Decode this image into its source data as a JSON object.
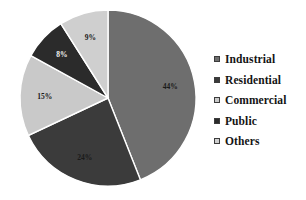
{
  "chart_data": {
    "type": "pie",
    "title": "",
    "subtitle": "",
    "xlabel": "",
    "ylabel": "",
    "grid": false,
    "legend_position": "right",
    "unit": "%",
    "categories": [
      "Industrial",
      "Residential",
      "Commercial",
      "Public",
      "Others"
    ],
    "values": [
      44,
      24,
      15,
      8,
      9
    ],
    "data_labels": [
      "44%",
      "24%",
      "15%",
      "8%",
      "9%"
    ],
    "colors": [
      "#6e6e6e",
      "#3b3b3b",
      "#c9c9c9",
      "#2b2b2b",
      "#cfcfcf"
    ],
    "slices": [
      {
        "name": "Industrial",
        "value": 44,
        "label": "44%",
        "color": "#6e6e6e",
        "label_color": "dark"
      },
      {
        "name": "Residential",
        "value": 24,
        "label": "24%",
        "color": "#3b3b3b",
        "label_color": "dark"
      },
      {
        "name": "Commercial",
        "value": 15,
        "label": "15%",
        "color": "#c9c9c9",
        "label_color": "dark"
      },
      {
        "name": "Public",
        "value": 8,
        "label": "8%",
        "color": "#2b2b2b",
        "label_color": "light"
      },
      {
        "name": "Others",
        "value": 9,
        "label": "9%",
        "color": "#cfcfcf",
        "label_color": "dark"
      }
    ]
  },
  "legend": {
    "items": [
      {
        "label": "Industrial",
        "swatch": "#6e6e6e"
      },
      {
        "label": "Residential",
        "swatch": "#3b3b3b"
      },
      {
        "label": "Commercial",
        "swatch": "#c9c9c9"
      },
      {
        "label": "Public",
        "swatch": "#2b2b2b"
      },
      {
        "label": "Others",
        "swatch": "#cfcfcf"
      }
    ]
  },
  "geometry": {
    "cx": 108,
    "cy": 98,
    "r": 88,
    "start_angle_deg": -90,
    "direction": "clockwise",
    "label_radius_factor": 0.72
  }
}
